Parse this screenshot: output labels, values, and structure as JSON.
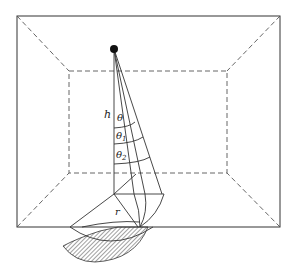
{
  "figure": {
    "labels": {
      "height": "h",
      "angle0": "θ",
      "angle1": "θ1",
      "angle1_base": "θ",
      "angle1_sub": "1",
      "angle2_base": "θ",
      "angle2_sub": "2",
      "radius": "r"
    },
    "colors": {
      "line": "#333333",
      "dashed": "#555555",
      "hatch": "#444444",
      "source": "#111111"
    }
  }
}
